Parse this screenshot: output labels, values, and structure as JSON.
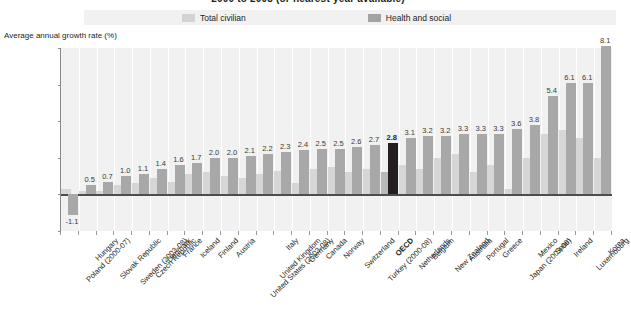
{
  "figure": {
    "title": "2000 to 2008 (or nearest year available)",
    "axis_title": "Average annual growth rate (%)"
  },
  "legend": {
    "items": [
      {
        "label": "Total civilian",
        "color": "#d3d3d3",
        "icon": "legend-swatch-icon"
      },
      {
        "label": "Health and social",
        "color": "#a3a3a3",
        "icon": "legend-swatch-icon"
      }
    ]
  },
  "chart_data": {
    "type": "bar",
    "title": "2000 to 2008 (or nearest year available)",
    "xlabel": "",
    "ylabel": "Average annual growth rate (%)",
    "ylim": [
      -2,
      8
    ],
    "yticks": [
      -2,
      0,
      2,
      4,
      6,
      8
    ],
    "grid": true,
    "legend_position": "top",
    "highlight_category": "OECD",
    "highlight_color": "#231f20",
    "categories": [
      "Poland (2000-07)",
      "Hungary",
      "Slovak Republic",
      "Sweden (2003-08)",
      "Czech Republic",
      "Denmark",
      "France",
      "Iceland",
      "Finland",
      "Austria",
      "United States (2003-08)",
      "United Kingdom",
      "Italy",
      "Germany",
      "Canada",
      "Norway",
      "Switzerland",
      "Turkey (2000-08)",
      "OECD",
      "Netherlands",
      "Belgium",
      "New Zealand",
      "Australia",
      "Portugal",
      "Greece",
      "Japan (2003-06)",
      "Mexico",
      "Spain",
      "Ireland",
      "Luxembourg",
      "Korea"
    ],
    "series": [
      {
        "name": "Health and social",
        "color": "#a8a8a8",
        "values": [
          -1.1,
          0.5,
          0.7,
          1.0,
          1.1,
          1.4,
          1.6,
          1.7,
          2.0,
          2.0,
          2.1,
          2.2,
          2.3,
          2.4,
          2.5,
          2.5,
          2.6,
          2.7,
          2.8,
          3.1,
          3.2,
          3.2,
          3.3,
          3.3,
          3.3,
          3.6,
          3.8,
          5.4,
          6.1,
          6.1,
          8.1
        ]
      },
      {
        "name": "Total civilian",
        "color": "#d6d6d6",
        "values": [
          0.3,
          0.2,
          0.2,
          0.5,
          0.6,
          0.9,
          0.7,
          1.1,
          1.2,
          1.0,
          0.9,
          1.1,
          1.3,
          0.6,
          1.4,
          1.5,
          1.2,
          1.4,
          1.2,
          1.6,
          1.4,
          2.0,
          2.2,
          1.2,
          1.6,
          0.3,
          2.0,
          3.3,
          3.5,
          3.1,
          2.0
        ]
      }
    ],
    "data_labels": [
      "-1.1",
      "0.5",
      "0.7",
      "1.0",
      "1.1",
      "1.4",
      "1.6",
      "1.7",
      "2.0",
      "2.0",
      "2.1",
      "2.2",
      "2.3",
      "2.4",
      "2.5",
      "2.5",
      "2.6",
      "2.7",
      "2.8",
      "3.1",
      "3.2",
      "3.2",
      "3.3",
      "3.3",
      "3.3",
      "3.6",
      "3.8",
      "5.4",
      "6.1",
      "6.1",
      "8.1"
    ]
  }
}
